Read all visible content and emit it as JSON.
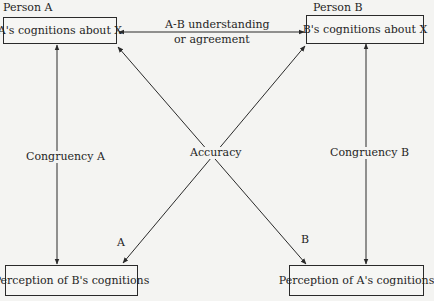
{
  "diagram": {
    "person_a_label": "Person A",
    "person_b_label": "Person B",
    "box_a_cognitions": "A's cognitions about X",
    "box_b_cognitions": "B's cognitions about X",
    "box_perception_b": "Perception of B's cognitions",
    "box_perception_a": "Perception of A's cognitions",
    "understanding_line1": "A-B understanding",
    "understanding_line2": "or agreement",
    "congruency_a": "Congruency A",
    "congruency_b": "Congruency B",
    "accuracy": "Accuracy",
    "accuracy_a_label": "A",
    "accuracy_b_label": "B"
  },
  "colors": {
    "line": "#2a2a2a",
    "background": "#f4f4f2"
  }
}
